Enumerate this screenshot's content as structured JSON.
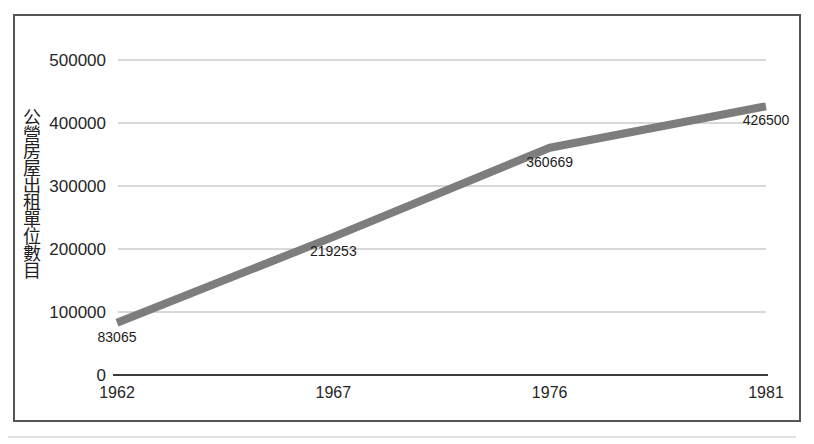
{
  "chart_data": {
    "type": "line",
    "title": "",
    "xlabel": "",
    "ylabel": "公營房屋出租單位數目",
    "categories": [
      "1962",
      "1967",
      "1976",
      "1981"
    ],
    "series": [
      {
        "name": "公營房屋出租單位數目",
        "values": [
          83065,
          219253,
          360669,
          426500
        ]
      }
    ],
    "data_labels": [
      "83065",
      "219253",
      "360669",
      "426500"
    ],
    "y_ticks": [
      {
        "label": "500000",
        "value": 500000
      },
      {
        "label": "400000",
        "value": 400000
      },
      {
        "label": "300000",
        "value": 300000
      },
      {
        "label": "200000",
        "value": 200000
      },
      {
        "label": "100000",
        "value": 100000
      },
      {
        "label": "0",
        "value": 0
      }
    ],
    "ylim": [
      0,
      500000
    ],
    "grid": "horizontal",
    "legend_position": "none",
    "colors": {
      "line": "#7d7d7d",
      "grid": "#b2b2b2",
      "axis": "#3c3c3c",
      "frame": "#555555",
      "text": "#262626"
    }
  }
}
